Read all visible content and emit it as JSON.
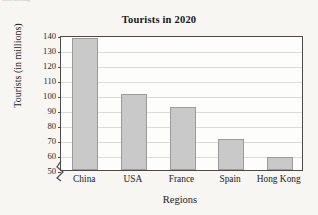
{
  "artifact": {
    "text": "marketing"
  },
  "chart_data": {
    "type": "bar",
    "title": "Tourists in 2020",
    "xlabel": "Regions",
    "ylabel": "Tourists (in millions)",
    "categories": [
      "China",
      "USA",
      "France",
      "Spain",
      "Hong Kong"
    ],
    "values": [
      138,
      101,
      92,
      71,
      58.5
    ],
    "ylim": [
      50,
      140
    ],
    "ytick_step": 10,
    "yticks": [
      50,
      60,
      70,
      80,
      90,
      100,
      110,
      120,
      130,
      140
    ],
    "ytick_labels": [
      "50",
      "60",
      "70",
      "80",
      "90",
      "100",
      "110",
      "120",
      "130",
      "140"
    ],
    "grid": true,
    "axis_break": true,
    "legend": "none",
    "colors": {
      "bar_fill": "#c9c9c9",
      "bar_stroke": "#9b9b9b",
      "axis": "#4a4a4d",
      "gridline": "#dcdcda",
      "text": "#1b1b1e",
      "background": "#f7f6f3",
      "plot_background": "#fdfdfc"
    }
  }
}
